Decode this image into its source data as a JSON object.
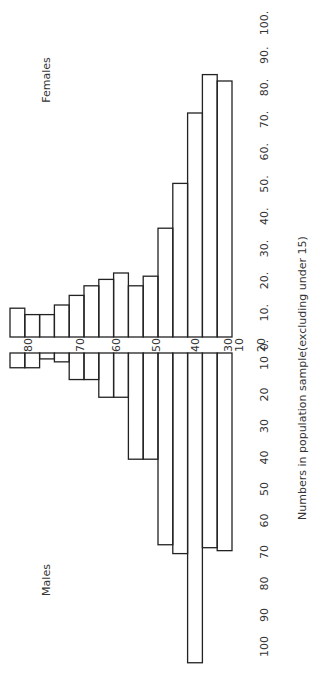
{
  "chart_data": {
    "type": "bar",
    "subtype": "population-pyramid (rotated 90°)",
    "title": "",
    "xlabel": "Numbers in population sample(excluding under 15)",
    "ylabel": "Age",
    "series_labels": {
      "top": "Females",
      "bottom": "Males"
    },
    "age_tick_labels": [
      "80",
      "70",
      "60",
      "50",
      "40",
      "30",
      "20",
      "10"
    ],
    "female_axis_ticks": [
      "0.",
      "10.",
      "20.",
      "30.",
      "40.",
      "50.",
      "60.",
      "70.",
      "80.",
      "90.",
      "100."
    ],
    "male_axis_ticks": [
      "10",
      "20",
      "30",
      "40",
      "50",
      "60",
      "70",
      "80",
      "90",
      "100"
    ],
    "xlim": [
      0,
      100
    ],
    "categories": [
      "85+",
      "80-85",
      "75-80",
      "70-75",
      "65-70",
      "60-65",
      "55-60",
      "50-55",
      "45-50",
      "40-45",
      "35-40",
      "30-35",
      "25-30",
      "20-25",
      "15-20"
    ],
    "series": [
      {
        "name": "Females",
        "values": [
          9,
          7,
          7,
          10,
          13,
          16,
          18,
          20,
          16,
          19,
          34,
          48,
          70,
          82,
          80
        ]
      },
      {
        "name": "Males",
        "values": [
          5,
          5,
          2,
          3,
          9,
          9,
          15,
          15,
          36,
          36,
          65,
          68,
          105,
          66,
          67
        ]
      }
    ]
  }
}
